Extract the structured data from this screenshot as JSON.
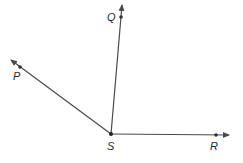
{
  "diagram": {
    "colors": {
      "line": "#4a4a4a",
      "label": "#2a2a2a",
      "background": "#ffffff"
    },
    "vertex": {
      "label": "S"
    },
    "rays": [
      {
        "label": "Q"
      },
      {
        "label": "P"
      },
      {
        "label": "R"
      }
    ]
  }
}
